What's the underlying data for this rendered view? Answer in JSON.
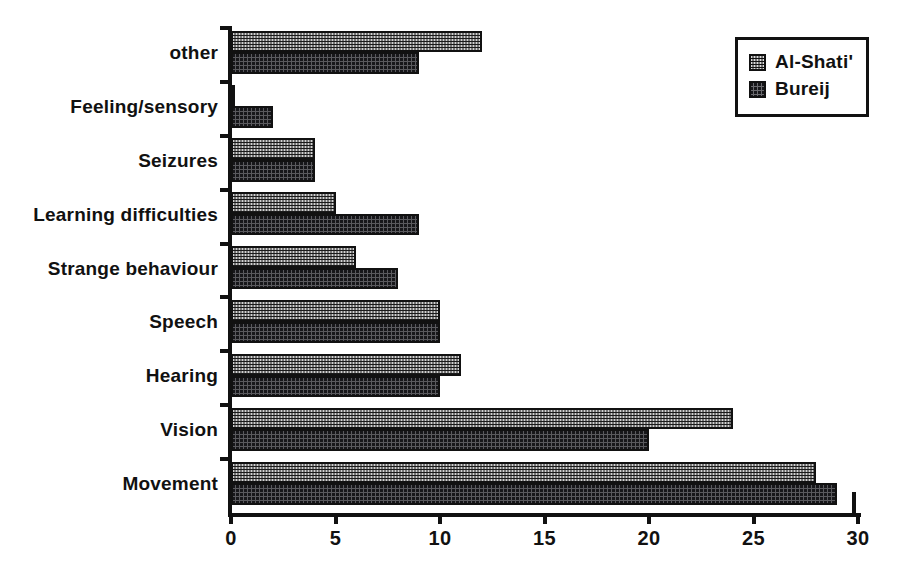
{
  "chart_data": {
    "type": "bar",
    "orientation": "horizontal",
    "title": "",
    "xlabel": "",
    "ylabel": "",
    "xlim": [
      0,
      30
    ],
    "xticks": [
      0,
      5,
      10,
      15,
      20,
      25,
      30
    ],
    "xtick_labels": [
      "0",
      "5",
      "10",
      "15",
      "20",
      "25",
      "30"
    ],
    "grid": false,
    "legend_position": "top-right",
    "categories": [
      "Movement",
      "Vision",
      "Hearing",
      "Speech",
      "Strange behaviour",
      "Learning difficulties",
      "Seizures",
      "Feeling/sensory",
      "other"
    ],
    "series": [
      {
        "name": "Al-Shati'",
        "color": "#d2d2d2",
        "pattern": "light-checker",
        "values": [
          28,
          24,
          11,
          10,
          6,
          5,
          4,
          0.2,
          12
        ]
      },
      {
        "name": "Bureij",
        "color": "#17171a",
        "pattern": "dark-dither",
        "values": [
          29,
          20,
          10,
          10,
          8,
          9,
          4,
          2,
          9
        ]
      }
    ]
  },
  "legend": {
    "items": [
      {
        "label": "Al-Shati'",
        "series": "a"
      },
      {
        "label": "Bureij",
        "series": "b"
      }
    ]
  },
  "colors": {
    "axis": "#111111",
    "background": "#ffffff",
    "series_a": "#d2d2d2",
    "series_b": "#17171a"
  }
}
